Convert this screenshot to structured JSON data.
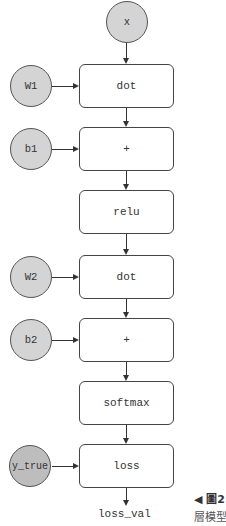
{
  "diagram": {
    "input_node": {
      "label": "x"
    },
    "operations": [
      {
        "label": "dot",
        "side_input": "W1"
      },
      {
        "label": "+",
        "side_input": "b1"
      },
      {
        "label": "relu",
        "side_input": null
      },
      {
        "label": "dot",
        "side_input": "W2"
      },
      {
        "label": "+",
        "side_input": "b2"
      },
      {
        "label": "softmax",
        "side_input": null
      },
      {
        "label": "loss",
        "side_input": "y_true"
      }
    ],
    "side_inputs": {
      "W1": "W1",
      "b1": "b1",
      "W2": "W2",
      "b2": "b2",
      "y_true": "y_true"
    },
    "output": "loss_val"
  },
  "caption": {
    "marker": "◀ 圖2",
    "text": "層模型"
  },
  "colors": {
    "node_fill": "#d4d4d4",
    "box_fill": "#ffffff",
    "stroke": "#444444"
  }
}
